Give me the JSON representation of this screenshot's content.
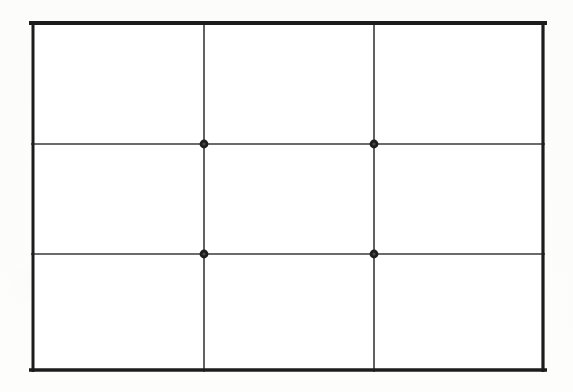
{
  "figure": {
    "canvas": {
      "width": 573,
      "height": 392,
      "background_color": "#fdfdfc"
    },
    "frame": {
      "x": 31,
      "y": 21,
      "width": 514,
      "height": 351,
      "stroke_color": "#1c1c1c",
      "stroke_width": 4,
      "fill_color": "#ffffff"
    },
    "grid": {
      "columns": 3,
      "rows": 3,
      "line_color": "#3a3a3a",
      "line_width": 1.6,
      "vertical_lines_x": [
        204,
        374
      ],
      "horizontal_lines_y": [
        144,
        254
      ]
    },
    "intersection_points": [
      {
        "label": "top-left-third",
        "x": 204,
        "y": 144
      },
      {
        "label": "top-right-third",
        "x": 374,
        "y": 144
      },
      {
        "label": "bottom-left-third",
        "x": 204,
        "y": 254
      },
      {
        "label": "bottom-right-third",
        "x": 374,
        "y": 254
      }
    ],
    "point_style": {
      "radius": 4.4,
      "fill_color": "#1e1e1e",
      "inner_radius": 1.6,
      "inner_fill_color": "#4a4a4a"
    }
  }
}
